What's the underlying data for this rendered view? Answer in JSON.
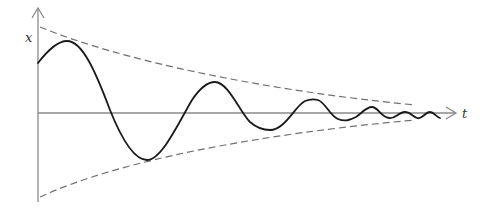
{
  "figure": {
    "axes": {
      "x_label": "t",
      "y_label": "x"
    },
    "colors": {
      "axis": "#8a8a8a",
      "envelope": "#707070",
      "curve": "#1a1a1a"
    },
    "elements": {
      "curve": "damped oscillation x(t)",
      "upper_envelope": "decaying exponential (dashed)",
      "lower_envelope": "negative decaying exponential (dashed)"
    }
  }
}
